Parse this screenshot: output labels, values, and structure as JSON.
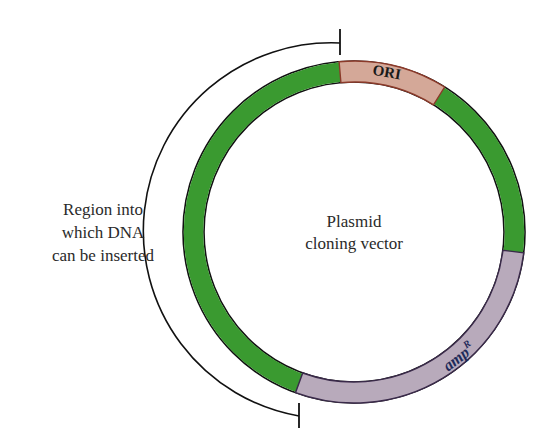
{
  "diagram": {
    "title": "Plasmid cloning vector",
    "center_label_line1": "Plasmid",
    "center_label_line2": "cloning vector",
    "region_label_line1": "Region into",
    "region_label_line2": "which DNA",
    "region_label_line3": "can be inserted",
    "segments": [
      {
        "name": "ORI",
        "label": "ORI",
        "color": "#d4a898",
        "stroke": "#8b3a2a",
        "start_deg": -5,
        "end_deg": 32
      },
      {
        "name": "backbone-right",
        "label": "",
        "color": "#3a9a30",
        "stroke": "#111111",
        "start_deg": 32,
        "end_deg": 97
      },
      {
        "name": "ampR",
        "label": "amp",
        "superscript": "R",
        "color": "#b8aabb",
        "stroke": "#3a2a4a",
        "start_deg": 97,
        "end_deg": 200
      },
      {
        "name": "insertion-region",
        "label": "",
        "color": "#3a9a30",
        "stroke": "#111111",
        "start_deg": 200,
        "end_deg": 355
      }
    ],
    "colors": {
      "green": "#3a9a30",
      "ori_fill": "#d4a898",
      "amp_fill": "#b8aabb",
      "text": "#2a2a2a",
      "label_blue": "#1f2a5a"
    }
  }
}
